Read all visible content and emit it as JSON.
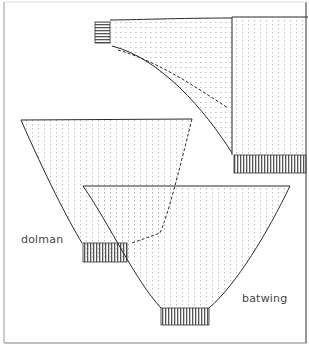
{
  "diagram": {
    "labels": {
      "dolman": "dolman",
      "batwing": "batwing"
    },
    "colors": {
      "line": "#2a2a2a",
      "fill": "#fbfbfb",
      "stipple": "#9a9a9a",
      "border": "#888888",
      "text": "#444444"
    }
  }
}
